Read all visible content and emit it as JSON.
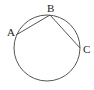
{
  "diagram": {
    "type": "geometry",
    "circle": {
      "cx": 47,
      "cy": 48,
      "r": 33
    },
    "points": [
      {
        "label": "A",
        "x": 15,
        "y": 35
      },
      {
        "label": "B",
        "x": 50,
        "y": 15
      },
      {
        "label": "C",
        "x": 80,
        "y": 48
      }
    ],
    "segments": [
      [
        "A",
        "B"
      ],
      [
        "B",
        "C"
      ]
    ],
    "stroke_color": "#555555"
  },
  "labels": {
    "a": "A",
    "b": "B",
    "c": "C"
  }
}
